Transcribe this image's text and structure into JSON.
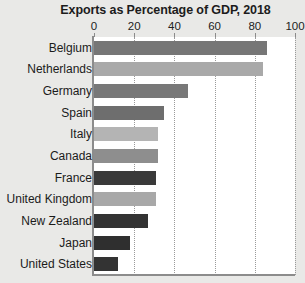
{
  "chart_data": {
    "type": "bar",
    "orientation": "horizontal",
    "title": "Exports as Percentage of GDP, 2018",
    "xlabel": "",
    "ylabel": "",
    "xlim": [
      0,
      100
    ],
    "xticks": [
      0,
      20,
      40,
      60,
      80,
      100
    ],
    "xtick_labels": [
      "0",
      "20",
      "40",
      "60",
      "80",
      "100"
    ],
    "grid": true,
    "grid_axis": "x",
    "grid_style": "dotted",
    "legend": false,
    "categories": [
      "Belgium",
      "Netherlands",
      "Germany",
      "Spain",
      "Italy",
      "Canada",
      "France",
      "United Kingdom",
      "New Zealand",
      "Japan",
      "United States"
    ],
    "values": [
      86,
      84,
      47,
      35,
      32,
      32,
      31,
      31,
      27,
      18,
      12
    ],
    "bar_colors": [
      "#767676",
      "#a9a9a9",
      "#787878",
      "#6e6e6e",
      "#b4b4b4",
      "#8e8e8e",
      "#3a3a3a",
      "#a8a8a8",
      "#333333",
      "#2f2f2f",
      "#333333"
    ]
  },
  "style": {
    "background": "#e9e9e7",
    "plot_background": "#ffffff",
    "axis_color": "#8c8c8c",
    "gridline_color": "#9a9a9a",
    "text_color": "#1b1b1b"
  }
}
